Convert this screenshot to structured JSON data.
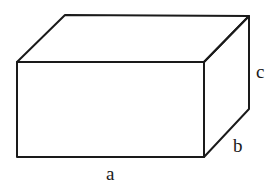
{
  "diagram": {
    "type": "rectangular-box",
    "labels": {
      "length": "a",
      "depth": "b",
      "height": "c"
    },
    "colors": {
      "stroke": "#1a1a1a",
      "background": "#ffffff"
    }
  }
}
